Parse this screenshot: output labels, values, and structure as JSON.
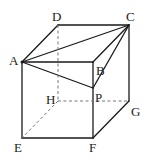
{
  "figure": {
    "type": "cube-with-point",
    "labels": {
      "A": "A",
      "B": "B",
      "C": "C",
      "D": "D",
      "E": "E",
      "F": "F",
      "G": "G",
      "H": "H",
      "P": "P"
    },
    "colors": {
      "solid": "#1a1a1a",
      "dashed": "#777777"
    }
  }
}
